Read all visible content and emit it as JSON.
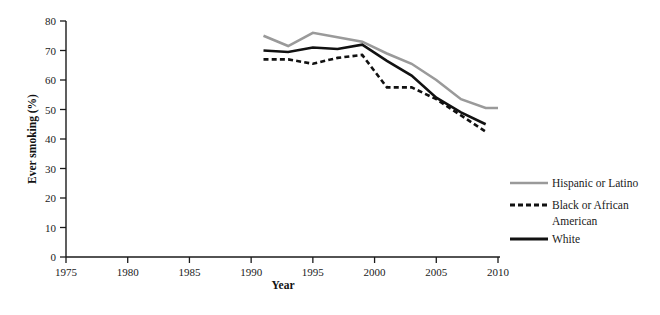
{
  "chart_data": {
    "type": "line",
    "title": "",
    "xlabel": "Year",
    "ylabel": "Ever smoking (%)",
    "xlim": [
      1975,
      2010
    ],
    "ylim": [
      0,
      80
    ],
    "xticks": [
      1975,
      1980,
      1985,
      1990,
      1995,
      2000,
      2005,
      2010
    ],
    "yticks": [
      0,
      10,
      20,
      30,
      40,
      50,
      60,
      70,
      80
    ],
    "grid": false,
    "legend_position": "right",
    "series": [
      {
        "name": "Hispanic or Latino",
        "style": "solid",
        "color": "#9a9a9a",
        "width": 2.6,
        "x": [
          1991,
          1993,
          1995,
          1997,
          1999,
          2001,
          2003,
          2005,
          2007,
          2009,
          2010
        ],
        "values": [
          75.0,
          71.5,
          76.0,
          74.5,
          73.0,
          69.0,
          65.5,
          60.0,
          53.5,
          50.5,
          50.5
        ]
      },
      {
        "name": "Black or African American",
        "style": "dashed",
        "color": "#111111",
        "width": 2.6,
        "x": [
          1991,
          1993,
          1995,
          1997,
          1999,
          2001,
          2003,
          2005,
          2007,
          2009
        ],
        "values": [
          67.0,
          67.0,
          65.5,
          67.5,
          68.5,
          57.5,
          57.5,
          53.5,
          48.0,
          42.5
        ]
      },
      {
        "name": "White",
        "style": "solid",
        "color": "#111111",
        "width": 2.6,
        "x": [
          1991,
          1993,
          1995,
          1997,
          1999,
          2001,
          2003,
          2005,
          2007,
          2009
        ],
        "values": [
          70.0,
          69.5,
          71.0,
          70.5,
          72.0,
          66.5,
          61.5,
          54.0,
          49.0,
          45.0
        ]
      }
    ]
  },
  "legend": {
    "items": [
      {
        "label": "Hispanic or Latino",
        "swatch": "solid-gray-line"
      },
      {
        "label": "Black or African",
        "label2": "American",
        "swatch": "dashed-black-line"
      },
      {
        "label": "White",
        "swatch": "solid-black-line"
      }
    ]
  },
  "axes": {
    "y_title": "Ever smoking (%)",
    "x_title": "Year",
    "y_tick_labels": [
      "80",
      "70",
      "60",
      "50",
      "40",
      "30",
      "20",
      "10",
      "0"
    ],
    "x_tick_labels": [
      "1975",
      "1980",
      "1985",
      "1990",
      "1995",
      "2000",
      "2005",
      "2010"
    ]
  },
  "colors": {
    "axis": "#1a1a1a",
    "hispanic": "#9a9a9a",
    "black_african_american": "#111111",
    "white": "#111111",
    "background": "#ffffff"
  }
}
